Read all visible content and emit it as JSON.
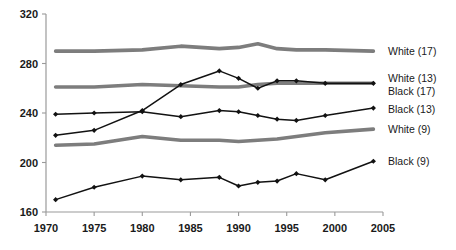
{
  "chart_data": {
    "type": "line",
    "title": "",
    "subtitle": "",
    "xlabel": "",
    "ylabel": "",
    "xlim": [
      1970,
      2005
    ],
    "ylim": [
      160,
      320
    ],
    "grid": false,
    "legend_position": "right-inline-labels",
    "x_ticks": [
      1970,
      1975,
      1980,
      1985,
      1990,
      1995,
      2000,
      2005
    ],
    "y_ticks": [
      160,
      200,
      240,
      280,
      320
    ],
    "x_tick_labels": [
      "1970",
      "1975",
      "1980",
      "1985",
      "1990",
      "1995",
      "2000",
      "2005"
    ],
    "y_tick_labels": [
      "160",
      "200",
      "240",
      "280",
      "320"
    ],
    "series": [
      {
        "name": "White (17)",
        "label": "White  (17)",
        "color": "#7d7d7d",
        "style": "thick-gray",
        "markers": false,
        "x": [
          1971,
          1975,
          1980,
          1984,
          1988,
          1990,
          1992,
          1994,
          1996,
          1999,
          2004
        ],
        "values": [
          290,
          290,
          291,
          294,
          292,
          293,
          296,
          292,
          291,
          291,
          290
        ]
      },
      {
        "name": "White (13)",
        "label": "White (13)",
        "color": "#7d7d7d",
        "style": "thick-gray",
        "markers": false,
        "x": [
          1971,
          1975,
          1980,
          1984,
          1988,
          1990,
          1992,
          1994,
          1996,
          1999,
          2004
        ],
        "values": [
          261,
          261,
          263,
          262,
          261,
          261,
          263,
          264,
          264,
          264,
          264
        ]
      },
      {
        "name": "Black (17)",
        "label": "Black (17)",
        "color": "#121212",
        "style": "thin-black",
        "markers": true,
        "x": [
          1971,
          1975,
          1980,
          1984,
          1988,
          1990,
          1992,
          1994,
          1996,
          1999,
          2004
        ],
        "values": [
          222,
          226,
          242,
          263,
          274,
          268,
          260,
          266,
          266,
          264,
          264
        ]
      },
      {
        "name": "Black (13)",
        "label": "Black (13)",
        "color": "#121212",
        "style": "thin-black",
        "markers": true,
        "x": [
          1971,
          1975,
          1980,
          1984,
          1988,
          1990,
          1992,
          1994,
          1996,
          1999,
          2004
        ],
        "values": [
          239,
          240,
          241,
          237,
          242,
          241,
          238,
          235,
          234,
          238,
          244
        ]
      },
      {
        "name": "White (9)",
        "label": "White (9)",
        "color": "#7d7d7d",
        "style": "thick-gray",
        "markers": false,
        "x": [
          1971,
          1975,
          1980,
          1984,
          1988,
          1990,
          1992,
          1994,
          1996,
          1999,
          2004
        ],
        "values": [
          214,
          215,
          221,
          218,
          218,
          217,
          218,
          219,
          221,
          224,
          227
        ]
      },
      {
        "name": "Black (9)",
        "label": "Black (9)",
        "color": "#121212",
        "style": "thin-black",
        "markers": true,
        "x": [
          1971,
          1975,
          1980,
          1984,
          1988,
          1990,
          1992,
          1994,
          1996,
          1999,
          2004
        ],
        "values": [
          170,
          180,
          189,
          186,
          188,
          181,
          184,
          185,
          191,
          186,
          201
        ]
      }
    ],
    "right_labels": [
      {
        "text": "White  (17)",
        "value": 290
      },
      {
        "text": "White (13)",
        "value": 268
      },
      {
        "text": "Black (17)",
        "value": 258
      },
      {
        "text": "Black (13)",
        "value": 243
      },
      {
        "text": "White (9)",
        "value": 227
      },
      {
        "text": "Black (9)",
        "value": 201
      }
    ]
  }
}
